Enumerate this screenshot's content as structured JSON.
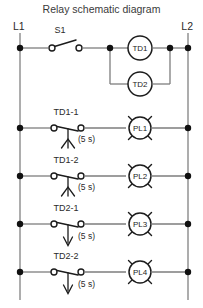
{
  "title": "Relay schematic diagram",
  "rails": {
    "left_label": "L1",
    "right_label": "L2"
  },
  "delay_label": "(5 s)",
  "rungs": [
    {
      "id": "rung-1",
      "contact": {
        "name": "S1",
        "type": "spst-switch-normally-open",
        "delay": ""
      },
      "loads": [
        {
          "name": "TD1",
          "type": "timer-relay-coil"
        },
        {
          "name": "TD2",
          "type": "timer-relay-coil"
        }
      ]
    },
    {
      "id": "rung-2",
      "contact": {
        "name": "TD1-1",
        "type": "on-delay-contact-normally-open",
        "delay": "(5 s)"
      },
      "loads": [
        {
          "name": "PL1",
          "type": "pilot-lamp"
        }
      ]
    },
    {
      "id": "rung-3",
      "contact": {
        "name": "TD1-2",
        "type": "on-delay-contact-normally-open",
        "delay": "(5 s)"
      },
      "loads": [
        {
          "name": "PL2",
          "type": "pilot-lamp"
        }
      ]
    },
    {
      "id": "rung-4",
      "contact": {
        "name": "TD2-1",
        "type": "off-delay-contact-normally-open",
        "delay": "(5 s)"
      },
      "loads": [
        {
          "name": "PL3",
          "type": "pilot-lamp"
        }
      ]
    },
    {
      "id": "rung-5",
      "contact": {
        "name": "TD2-2",
        "type": "off-delay-contact-normally-open",
        "delay": "(5 s)"
      },
      "loads": [
        {
          "name": "PL4",
          "type": "pilot-lamp"
        }
      ]
    }
  ],
  "colors": {
    "wire": "#7d7d7d",
    "symbol": "#1c1c1c",
    "node": "#111111",
    "text": "#2b2b2b",
    "background": "#ffffff"
  }
}
